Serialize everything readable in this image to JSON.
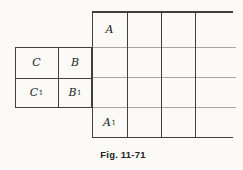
{
  "figure": {
    "caption": "Fig. 11-71",
    "labels": {
      "A": {
        "base": "A",
        "sub": ""
      },
      "A1": {
        "base": "A",
        "sub": "1"
      },
      "C": {
        "base": "C",
        "sub": ""
      },
      "B": {
        "base": "B",
        "sub": ""
      },
      "C1": {
        "base": "C",
        "sub": "1"
      },
      "B1": {
        "base": "B",
        "sub": "1"
      }
    },
    "colors": {
      "background": "#fbfaf7",
      "line_dark": "#3f3f3f",
      "line_light": "#a6a6a6",
      "text": "#1c1c1c"
    }
  }
}
